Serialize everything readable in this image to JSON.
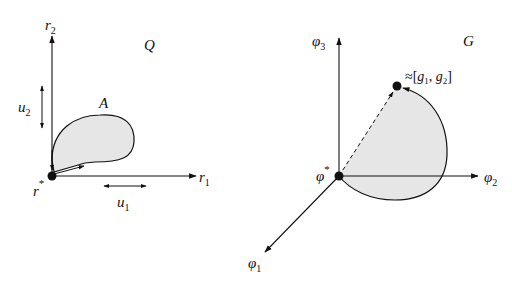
{
  "left_panel": {
    "space_label": "Q",
    "region_label": "A",
    "origin_label": "r",
    "origin_sup": "*",
    "axis_x": {
      "base": "r",
      "sub": "1"
    },
    "axis_y": {
      "base": "r",
      "sub": "2"
    },
    "step_x": {
      "base": "u",
      "sub": "1"
    },
    "step_y": {
      "base": "u",
      "sub": "2"
    }
  },
  "right_panel": {
    "space_label": "G",
    "origin_label": "φ",
    "origin_sup": "*",
    "axis_1": {
      "base": "φ",
      "sub": "1"
    },
    "axis_2": {
      "base": "φ",
      "sub": "2"
    },
    "axis_3": {
      "base": "φ",
      "sub": "3"
    },
    "point_label_prefix": "≈[",
    "point_g1": {
      "base": "g",
      "sub": "1"
    },
    "point_sep": ", ",
    "point_g2": {
      "base": "g",
      "sub": "2"
    },
    "point_label_suffix": "]"
  },
  "colors": {
    "ink": "#111111",
    "region_fill": "#e6e6e6"
  }
}
